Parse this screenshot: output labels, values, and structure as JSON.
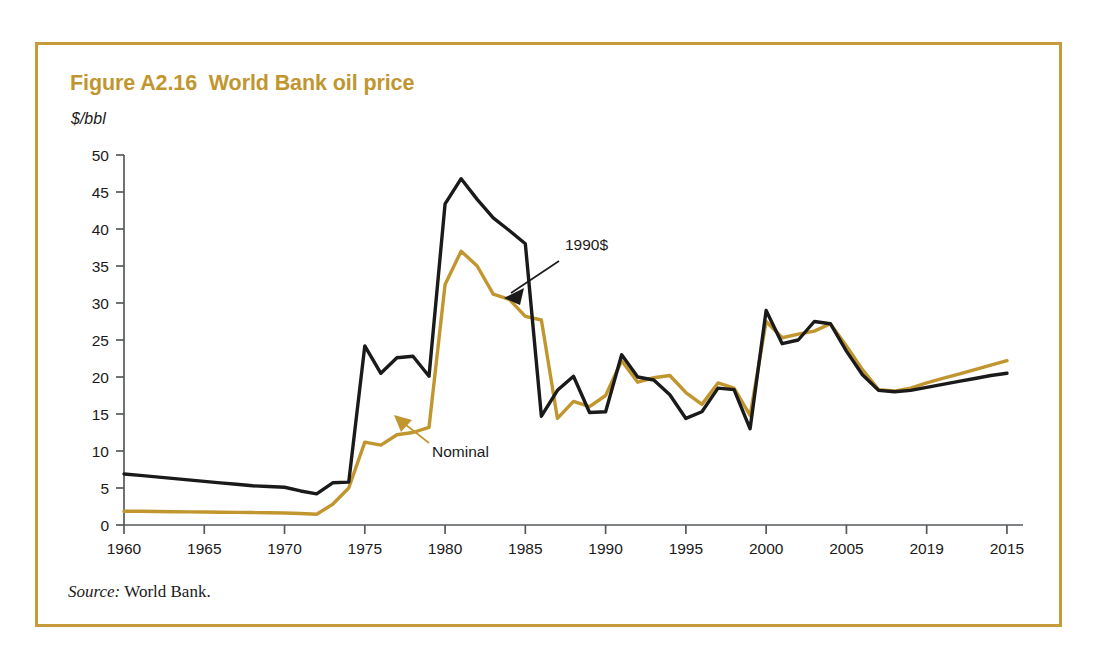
{
  "figure": {
    "title": "Figure A2.16  World Bank oil price",
    "y_unit_label": "$/bbl",
    "source_label": "Source:",
    "source_text": " World Bank.",
    "frame_color": "#C79A3C",
    "title_color": "#C2962F"
  },
  "chart_data": {
    "type": "line",
    "title": "Figure A2.16  World Bank oil price",
    "xlabel": "",
    "ylabel": "$/bbl",
    "ylim": [
      0,
      50
    ],
    "xlim": [
      1960,
      2016
    ],
    "ytick_labels": [
      "0",
      "5",
      "10",
      "15",
      "20",
      "25",
      "30",
      "35",
      "40",
      "45",
      "50"
    ],
    "ytick_values": [
      0,
      5,
      10,
      15,
      20,
      25,
      30,
      35,
      40,
      45,
      50
    ],
    "xtick_labels": [
      "1960",
      "1965",
      "1970",
      "1975",
      "1980",
      "1985",
      "1990",
      "1995",
      "2000",
      "2005",
      "2019",
      "2015"
    ],
    "xtick_values": [
      1960,
      1965,
      1970,
      1975,
      1980,
      1985,
      1990,
      1995,
      2000,
      2005,
      2010,
      2015
    ],
    "grid": false,
    "legend": "annotations",
    "annotations": [
      {
        "text": "1990$",
        "series": "1990$",
        "color": "#1a1a1a",
        "arrow_color": "#1a1a1a"
      },
      {
        "text": "Nominal",
        "series": "Nominal",
        "color": "#1a1a1a",
        "arrow_color": "#C2962F"
      }
    ],
    "x": [
      1960,
      1961,
      1962,
      1963,
      1964,
      1965,
      1966,
      1967,
      1968,
      1969,
      1970,
      1971,
      1972,
      1973,
      1974,
      1975,
      1976,
      1977,
      1978,
      1979,
      1980,
      1981,
      1982,
      1983,
      1984,
      1985,
      1986,
      1987,
      1988,
      1989,
      1990,
      1991,
      1992,
      1993,
      1994,
      1995,
      1996,
      1997,
      1998,
      1999,
      2000,
      2001,
      2002,
      2003,
      2004,
      2005,
      2006,
      2007,
      2008,
      2009,
      2010,
      2011,
      2012,
      2013,
      2014,
      2015
    ],
    "series": [
      {
        "name": "1990$",
        "color": "#1a1a1a",
        "values": [
          6.9,
          6.7,
          6.5,
          6.3,
          6.1,
          5.9,
          5.7,
          5.5,
          5.3,
          5.2,
          5.1,
          4.6,
          4.2,
          5.7,
          5.8,
          24.2,
          20.5,
          22.6,
          22.8,
          20.1,
          43.4,
          46.8,
          44.0,
          41.5,
          39.8,
          38.0,
          14.7,
          18.2,
          20.1,
          15.2,
          15.3,
          23.0,
          20.0,
          19.6,
          17.6,
          14.4,
          15.3,
          18.5,
          18.3,
          13.0,
          29.0,
          24.5,
          25.0,
          27.5,
          27.2,
          23.5,
          20.3,
          18.2,
          18.0,
          18.2,
          18.6,
          19.0,
          19.4,
          19.8,
          20.2,
          20.5
        ]
      },
      {
        "name": "Nominal",
        "color": "#C2962F",
        "values": [
          1.85,
          1.85,
          1.82,
          1.8,
          1.78,
          1.75,
          1.72,
          1.7,
          1.68,
          1.65,
          1.62,
          1.55,
          1.45,
          2.8,
          5.0,
          11.2,
          10.8,
          12.2,
          12.5,
          13.2,
          32.5,
          37.0,
          35.0,
          31.2,
          30.5,
          28.2,
          27.7,
          14.4,
          16.7,
          16.0,
          17.5,
          22.2,
          19.3,
          19.9,
          20.2,
          17.9,
          16.3,
          19.2,
          18.5,
          14.8,
          27.5,
          25.3,
          25.8,
          26.2,
          27.2,
          24.2,
          21.0,
          18.3,
          18.1,
          18.5,
          19.2,
          19.8,
          20.4,
          21.0,
          21.6,
          22.2
        ]
      }
    ]
  }
}
